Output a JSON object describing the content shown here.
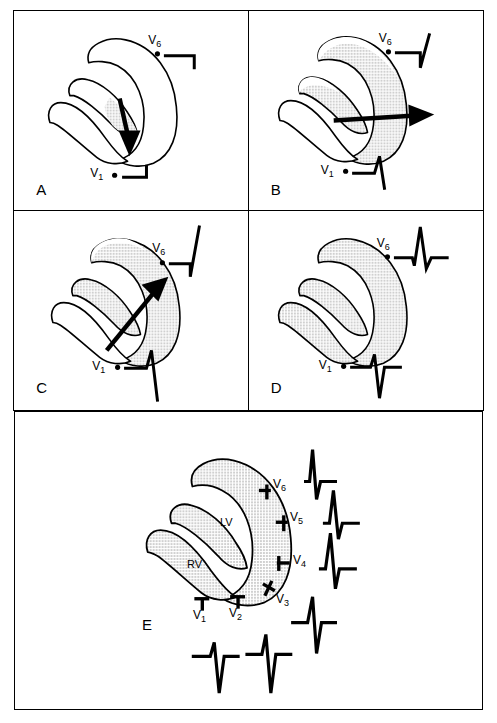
{
  "figure": {
    "panels": [
      {
        "letter": "A",
        "caption": "Septal depolarization: initial vector directed inferiorly and to the right",
        "arrow": {
          "label": "septal-depolarization-vector",
          "direction": "down-left"
        },
        "shaded_region": "interventricular-septum",
        "leads": [
          {
            "name": "V6",
            "label": "V",
            "subscript": "6",
            "waveform": "initial small q wave (downward deflection)"
          },
          {
            "name": "V1",
            "label": "V",
            "subscript": "1",
            "waveform": "initial small r wave (upward deflection)"
          }
        ]
      },
      {
        "letter": "B",
        "caption": "Early free wall depolarization: vector directed leftward toward V6",
        "arrow": {
          "label": "free-wall-depolarization-vector",
          "direction": "right"
        },
        "shaded_region": "septum-and-apical-free-wall",
        "leads": [
          {
            "name": "V6",
            "label": "V",
            "subscript": "6",
            "waveform": "q wave followed by rising R upstroke"
          },
          {
            "name": "V1",
            "label": "V",
            "subscript": "1",
            "waveform": "r wave followed by descending S"
          }
        ]
      },
      {
        "letter": "C",
        "caption": "Late left ventricular depolarization: vector directed superiorly and leftward",
        "arrow": {
          "label": "left-ventricular-vector",
          "direction": "up-right"
        },
        "shaded_region": "most-of-left-ventricular-wall",
        "leads": [
          {
            "name": "V6",
            "label": "V",
            "subscript": "6",
            "waveform": "tall R wave at peak"
          },
          {
            "name": "V1",
            "label": "V",
            "subscript": "1",
            "waveform": "deep S wave descending"
          }
        ]
      },
      {
        "letter": "D",
        "caption": "Complete ventricular depolarization and resultant QRS complexes",
        "arrow": null,
        "shaded_region": "entire-myocardium",
        "leads": [
          {
            "name": "V6",
            "label": "V",
            "subscript": "6",
            "waveform": "complete qRs complex"
          },
          {
            "name": "V1",
            "label": "V",
            "subscript": "1",
            "waveform": "complete rS complex"
          }
        ]
      }
    ],
    "panel_e": {
      "letter": "E",
      "caption": "Normal R wave progression across the precordial leads V1 to V6",
      "chambers": [
        {
          "name": "LV",
          "label": "LV",
          "description": "left ventricle"
        },
        {
          "name": "RV",
          "label": "RV",
          "description": "right ventricle"
        }
      ],
      "leads": [
        {
          "name": "V1",
          "label": "V",
          "subscript": "1",
          "waveform": "small r, deep S (rS)"
        },
        {
          "name": "V2",
          "label": "V",
          "subscript": "2",
          "waveform": "slightly taller r, deep S (rS)"
        },
        {
          "name": "V3",
          "label": "V",
          "subscript": "3",
          "waveform": "equiphasic RS, transition zone"
        },
        {
          "name": "V4",
          "label": "V",
          "subscript": "4",
          "waveform": "tall R with s wave"
        },
        {
          "name": "V5",
          "label": "V",
          "subscript": "5",
          "waveform": "tall R with small s"
        },
        {
          "name": "V6",
          "label": "V",
          "subscript": "6",
          "waveform": "tall R with small q and s (qRs)"
        }
      ]
    }
  },
  "style": {
    "ink": "#000000",
    "paper": "#ffffff",
    "myocardium_fill": "#b9b9b9",
    "border": "#000000"
  }
}
